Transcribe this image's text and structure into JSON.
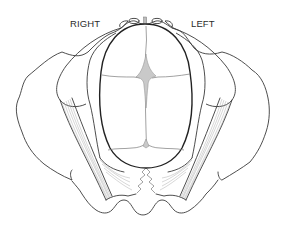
{
  "figure": {
    "type": "anatomical-line-illustration",
    "labels": {
      "right": "RIGHT",
      "left": "LEFT"
    },
    "colors": {
      "line": "#3a3a3a",
      "head_outline": "#222222",
      "fontanelle_fill": "#c9c9c9",
      "background": "#ffffff"
    }
  }
}
